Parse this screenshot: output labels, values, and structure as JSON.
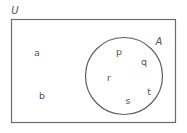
{
  "diagram": {
    "type": "venn-diagram",
    "universe": {
      "label": "U",
      "shape": "rectangle",
      "x": 11,
      "y": 19,
      "width": 165,
      "height": 104,
      "label_x": 15,
      "label_y": 11,
      "stroke": "#6b6b6b",
      "fill": "#ffffff"
    },
    "sets": [
      {
        "label": "A",
        "shape": "circle",
        "cx": 124,
        "cy": 76,
        "r": 39,
        "label_x": 159,
        "label_y": 42,
        "stroke": "#5e5e5e",
        "fill": "none"
      }
    ],
    "elements": [
      {
        "label": "a",
        "x": 37,
        "y": 53,
        "region": "outside-A"
      },
      {
        "label": "b",
        "x": 42,
        "y": 96,
        "region": "outside-A"
      },
      {
        "label": "p",
        "x": 119,
        "y": 52,
        "region": "inside-A"
      },
      {
        "label": "q",
        "x": 144,
        "y": 62,
        "region": "inside-A"
      },
      {
        "label": "r",
        "x": 109,
        "y": 78,
        "region": "inside-A"
      },
      {
        "label": "s",
        "x": 128,
        "y": 101,
        "region": "inside-A"
      },
      {
        "label": "t",
        "x": 149,
        "y": 92,
        "region": "inside-A"
      }
    ],
    "colors": {
      "stroke": "#6b6b6b",
      "text": "#555555",
      "background": "#ffffff"
    }
  }
}
